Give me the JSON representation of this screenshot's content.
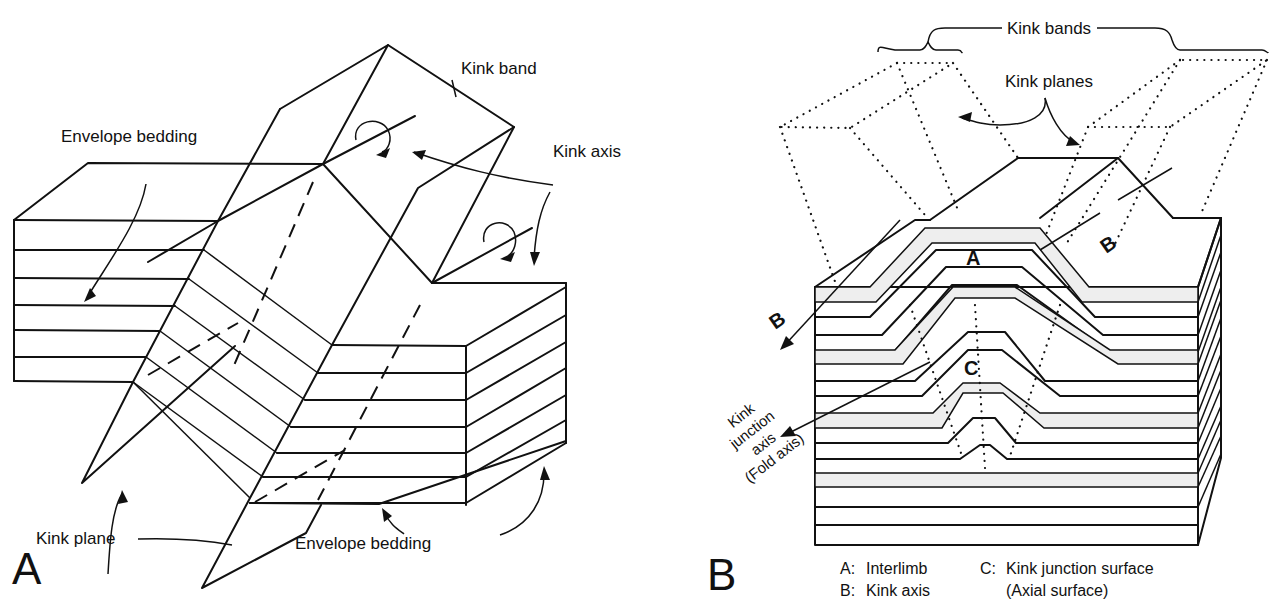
{
  "panel_a": {
    "letter": "A",
    "labels": {
      "kink_band": "Kink band",
      "envelope_bedding_top": "Envelope  bedding",
      "kink_axis": "Kink axis",
      "kink_plane": "Kink plane",
      "envelope_bedding_bottom": "Envelope  bedding"
    }
  },
  "panel_b": {
    "letter": "B",
    "labels": {
      "kink_bands": "Kink bands",
      "kink_planes": "Kink planes",
      "point_a": "A",
      "point_b_left": "B",
      "point_b_right": "B",
      "point_c": "C",
      "kink_junction_axis": [
        "Kink",
        "junction",
        "axis",
        "(Fold axis)"
      ]
    },
    "legend": [
      {
        "key": "A:",
        "text": "Interlimb"
      },
      {
        "key": "B:",
        "text": "Kink axis"
      },
      {
        "key": "C:",
        "text": "Kink junction surface"
      },
      {
        "key": "",
        "text": "(Axial  surface)"
      }
    ]
  },
  "colors": {
    "ink": "#111111",
    "paper": "#ffffff"
  }
}
